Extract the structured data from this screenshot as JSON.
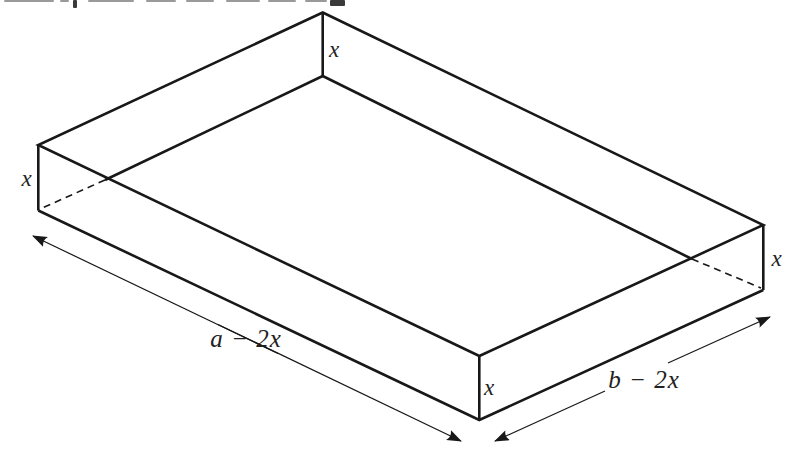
{
  "page": {
    "background": "#ffffff",
    "ink": "#181818",
    "label_color": "#222222"
  },
  "top_text_fragment": {
    "light_color": "#9a9a9a",
    "dark_color": "#3a3a3a",
    "marks": [
      {
        "x": 4,
        "w": 50,
        "h": 2,
        "shade": "light"
      },
      {
        "x": 60,
        "w": 9,
        "h": 2,
        "shade": "light"
      },
      {
        "x": 73,
        "w": 4,
        "h": 8,
        "shade": "dark"
      },
      {
        "x": 88,
        "w": 46,
        "h": 2,
        "shade": "light"
      },
      {
        "x": 146,
        "w": 30,
        "h": 2,
        "shade": "light"
      },
      {
        "x": 186,
        "w": 28,
        "h": 2,
        "shade": "light"
      },
      {
        "x": 226,
        "w": 34,
        "h": 2,
        "shade": "light"
      },
      {
        "x": 268,
        "w": 28,
        "h": 2,
        "shade": "light"
      },
      {
        "x": 305,
        "w": 22,
        "h": 2,
        "shade": "light"
      },
      {
        "x": 330,
        "w": 15,
        "h": 6,
        "shade": "dark"
      }
    ]
  },
  "diagram": {
    "labels": {
      "back_height": "x",
      "left_height": "x",
      "right_height": "x",
      "front_height": "x",
      "base_length": "a − 2x",
      "base_width": "b − 2x"
    }
  }
}
